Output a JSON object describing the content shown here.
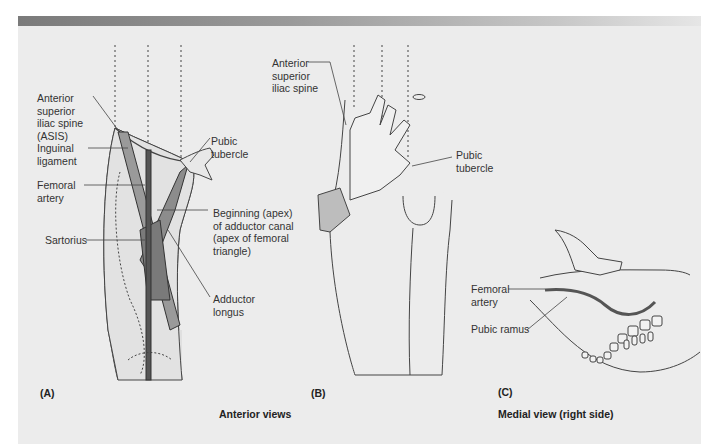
{
  "figure": {
    "panels": [
      {
        "id": "A",
        "letter": "(A)",
        "labels": {
          "asis": "Anterior\nsuperior\niliac spine\n(ASIS)",
          "inguinal_ligament": "Inguinal\nligament",
          "femoral_artery": "Femoral\nartery",
          "sartorius": "Sartorius",
          "pubic_tubercle": "Pubic\ntubercle",
          "apex": "Beginning (apex)\nof adductor canal\n(apex of femoral\ntriangle)",
          "adductor_longus": "Adductor\nlongus"
        }
      },
      {
        "id": "B",
        "letter": "(B)",
        "labels": {
          "asis": "Anterior\nsuperior\niliac spine",
          "pubic_tubercle": "Pubic\ntubercle"
        }
      },
      {
        "id": "C",
        "letter": "(C)",
        "labels": {
          "femoral_artery": "Femoral\nartery",
          "pubic_ramus": "Pubic ramus"
        }
      }
    ],
    "captions": {
      "anterior": "Anterior views",
      "medial": "Medial view (right side)"
    }
  },
  "colors": {
    "background": "#ececec",
    "banner_dark": "#7a7a7a",
    "banner_light": "#e6e6e6",
    "text": "#333333",
    "artery": "#555555"
  }
}
